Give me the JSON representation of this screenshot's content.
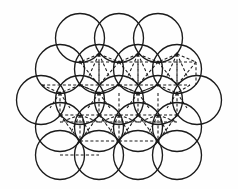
{
  "figure": {
    "name": "close-packed-sphere-stacking-diagram",
    "background_color": "#fefefe",
    "line_color": "#1a1a1a",
    "stroke_width": 1.35,
    "dashed_stroke_width": 1.05,
    "dash_pattern": "3 2.2"
  },
  "chart_data": {
    "type": "scatter",
    "xlabel": "",
    "ylabel": "",
    "xlim": [
      0,
      238
    ],
    "ylim": [
      0,
      189
    ],
    "grid": false,
    "legend": "none",
    "circle_radius": 24.5,
    "row_counts": [
      3,
      4,
      5,
      4,
      4
    ],
    "rows": [
      {
        "row": 1,
        "count": 3,
        "cy": 38,
        "cxs": [
          80,
          119,
          158
        ]
      },
      {
        "row": 2,
        "count": 4,
        "cy": 69,
        "cxs": [
          60,
          99,
          138,
          177
        ]
      },
      {
        "row": 3,
        "count": 5,
        "cy": 100,
        "cxs": [
          41,
          80,
          119,
          158,
          197
        ]
      },
      {
        "row": 4,
        "count": 4,
        "cy": 127,
        "cxs": [
          60,
          99,
          138,
          177
        ]
      },
      {
        "row": 5,
        "count": 4,
        "cy": 155,
        "cxs": [
          60,
          99,
          138,
          177
        ]
      }
    ],
    "circles": [
      {
        "cx": 80,
        "cy": 38,
        "r": 24.5
      },
      {
        "cx": 119,
        "cy": 38,
        "r": 24.5
      },
      {
        "cx": 158,
        "cy": 38,
        "r": 24.5
      },
      {
        "cx": 60,
        "cy": 69,
        "r": 24.5
      },
      {
        "cx": 99,
        "cy": 69,
        "r": 24.5
      },
      {
        "cx": 138,
        "cy": 69,
        "r": 24.5
      },
      {
        "cx": 177,
        "cy": 69,
        "r": 24.5
      },
      {
        "cx": 41,
        "cy": 100,
        "r": 24.5
      },
      {
        "cx": 80,
        "cy": 100,
        "r": 24.5
      },
      {
        "cx": 119,
        "cy": 100,
        "r": 24.5
      },
      {
        "cx": 158,
        "cy": 100,
        "r": 24.5
      },
      {
        "cx": 197,
        "cy": 100,
        "r": 24.5
      },
      {
        "cx": 60,
        "cy": 127,
        "r": 24.5
      },
      {
        "cx": 99,
        "cy": 127,
        "r": 24.5
      },
      {
        "cx": 138,
        "cy": 127,
        "r": 24.5
      },
      {
        "cx": 177,
        "cy": 127,
        "r": 24.5
      },
      {
        "cx": 60,
        "cy": 155,
        "r": 24.5
      },
      {
        "cx": 99,
        "cy": 155,
        "r": 24.5
      },
      {
        "cx": 138,
        "cy": 155,
        "r": 24.5
      },
      {
        "cx": 177,
        "cy": 155,
        "r": 24.5
      }
    ],
    "lattice_nodes": [
      {
        "x": 99,
        "y": 54
      },
      {
        "x": 138,
        "y": 54
      },
      {
        "x": 177,
        "y": 54
      },
      {
        "x": 80,
        "y": 62
      },
      {
        "x": 119,
        "y": 62
      },
      {
        "x": 158,
        "y": 62
      },
      {
        "x": 80,
        "y": 85
      },
      {
        "x": 119,
        "y": 85
      },
      {
        "x": 158,
        "y": 85
      },
      {
        "x": 60,
        "y": 93
      },
      {
        "x": 99,
        "y": 93
      },
      {
        "x": 138,
        "y": 93
      },
      {
        "x": 177,
        "y": 93
      },
      {
        "x": 60,
        "y": 115
      },
      {
        "x": 99,
        "y": 115
      },
      {
        "x": 138,
        "y": 115
      },
      {
        "x": 177,
        "y": 115
      },
      {
        "x": 80,
        "y": 141
      },
      {
        "x": 119,
        "y": 141
      },
      {
        "x": 158,
        "y": 141
      }
    ],
    "interstitial_polyhedra": [
      {
        "id": "tetra-top-left",
        "kind": "tetrahedron",
        "apex": {
          "x": 99,
          "y": 54
        },
        "base": [
          {
            "x": 80,
            "y": 62
          },
          {
            "x": 119,
            "y": 62
          },
          {
            "x": 99,
            "y": 85
          }
        ]
      },
      {
        "id": "tetra-top-mid",
        "kind": "tetrahedron",
        "apex": {
          "x": 138,
          "y": 54
        },
        "base": [
          {
            "x": 119,
            "y": 62
          },
          {
            "x": 158,
            "y": 62
          },
          {
            "x": 138,
            "y": 85
          }
        ]
      },
      {
        "id": "tetra-top-right",
        "kind": "tetrahedron",
        "apex": {
          "x": 177,
          "y": 54
        },
        "base": [
          {
            "x": 158,
            "y": 62
          },
          {
            "x": 196,
            "y": 62
          },
          {
            "x": 177,
            "y": 85
          }
        ]
      },
      {
        "id": "octa-center-left",
        "kind": "octahedron",
        "vertices": [
          {
            "x": 80,
            "y": 85
          },
          {
            "x": 119,
            "y": 85
          },
          {
            "x": 99,
            "y": 93
          },
          {
            "x": 99,
            "y": 62
          }
        ]
      },
      {
        "id": "octa-center-right",
        "kind": "octahedron",
        "vertices": [
          {
            "x": 138,
            "y": 85
          },
          {
            "x": 177,
            "y": 85
          },
          {
            "x": 158,
            "y": 93
          },
          {
            "x": 158,
            "y": 62
          }
        ]
      },
      {
        "id": "tetra-mid-left",
        "kind": "tetrahedron",
        "apex": {
          "x": 99,
          "y": 93
        },
        "base": [
          {
            "x": 80,
            "y": 85
          },
          {
            "x": 119,
            "y": 85
          },
          {
            "x": 99,
            "y": 115
          }
        ]
      },
      {
        "id": "tetra-mid-center",
        "kind": "tetrahedron",
        "apex": {
          "x": 138,
          "y": 93
        },
        "base": [
          {
            "x": 119,
            "y": 85
          },
          {
            "x": 158,
            "y": 85
          },
          {
            "x": 138,
            "y": 115
          }
        ]
      },
      {
        "id": "tetra-lower-left",
        "kind": "tetrahedron",
        "apex": {
          "x": 80,
          "y": 115
        },
        "base": [
          {
            "x": 60,
            "y": 122
          },
          {
            "x": 99,
            "y": 122
          },
          {
            "x": 80,
            "y": 141
          }
        ]
      },
      {
        "id": "tetra-lower-mid",
        "kind": "tetrahedron",
        "apex": {
          "x": 119,
          "y": 115
        },
        "base": [
          {
            "x": 99,
            "y": 122
          },
          {
            "x": 138,
            "y": 122
          },
          {
            "x": 119,
            "y": 141
          }
        ]
      },
      {
        "id": "tetra-lower-right",
        "kind": "tetrahedron",
        "apex": {
          "x": 158,
          "y": 115
        },
        "base": [
          {
            "x": 138,
            "y": 122
          },
          {
            "x": 177,
            "y": 122
          },
          {
            "x": 158,
            "y": 141
          }
        ]
      }
    ],
    "dashed_segments": [
      [
        80,
        62,
        119,
        62
      ],
      [
        119,
        62,
        158,
        62
      ],
      [
        158,
        62,
        196,
        62
      ],
      [
        80,
        62,
        99,
        85
      ],
      [
        119,
        62,
        99,
        85
      ],
      [
        119,
        62,
        138,
        85
      ],
      [
        158,
        62,
        138,
        85
      ],
      [
        158,
        62,
        177,
        85
      ],
      [
        196,
        62,
        177,
        85
      ],
      [
        99,
        54,
        80,
        62
      ],
      [
        99,
        54,
        119,
        62
      ],
      [
        99,
        54,
        99,
        85
      ],
      [
        99,
        54,
        88,
        78
      ],
      [
        99,
        54,
        110,
        78
      ],
      [
        138,
        54,
        119,
        62
      ],
      [
        138,
        54,
        158,
        62
      ],
      [
        138,
        54,
        138,
        85
      ],
      [
        138,
        54,
        127,
        78
      ],
      [
        138,
        54,
        149,
        78
      ],
      [
        177,
        54,
        158,
        62
      ],
      [
        177,
        54,
        196,
        62
      ],
      [
        177,
        54,
        177,
        85
      ],
      [
        177,
        54,
        166,
        78
      ],
      [
        177,
        54,
        188,
        78
      ],
      [
        80,
        85,
        119,
        85
      ],
      [
        119,
        85,
        158,
        85
      ],
      [
        158,
        85,
        190,
        85
      ],
      [
        42,
        85,
        80,
        85
      ],
      [
        80,
        85,
        99,
        93
      ],
      [
        119,
        85,
        99,
        93
      ],
      [
        119,
        85,
        138,
        93
      ],
      [
        158,
        85,
        138,
        93
      ],
      [
        158,
        85,
        177,
        93
      ],
      [
        190,
        85,
        177,
        93
      ],
      [
        42,
        85,
        60,
        93
      ],
      [
        80,
        85,
        60,
        93
      ],
      [
        99,
        93,
        80,
        85
      ],
      [
        99,
        93,
        119,
        85
      ],
      [
        99,
        93,
        99,
        115
      ],
      [
        99,
        93,
        88,
        108
      ],
      [
        99,
        93,
        110,
        108
      ],
      [
        138,
        93,
        119,
        85
      ],
      [
        138,
        93,
        158,
        85
      ],
      [
        138,
        93,
        138,
        115
      ],
      [
        138,
        93,
        127,
        108
      ],
      [
        138,
        93,
        149,
        108
      ],
      [
        60,
        93,
        60,
        115
      ],
      [
        60,
        93,
        50,
        108
      ],
      [
        60,
        93,
        70,
        108
      ],
      [
        177,
        93,
        177,
        115
      ],
      [
        177,
        93,
        167,
        108
      ],
      [
        177,
        93,
        187,
        108
      ],
      [
        60,
        115,
        99,
        115
      ],
      [
        99,
        115,
        138,
        115
      ],
      [
        138,
        115,
        177,
        115
      ],
      [
        60,
        115,
        80,
        141
      ],
      [
        99,
        115,
        80,
        141
      ],
      [
        99,
        115,
        119,
        141
      ],
      [
        138,
        115,
        119,
        141
      ],
      [
        138,
        115,
        158,
        141
      ],
      [
        177,
        115,
        158,
        141
      ],
      [
        80,
        115,
        60,
        122
      ],
      [
        80,
        115,
        99,
        122
      ],
      [
        80,
        115,
        80,
        141
      ],
      [
        80,
        115,
        70,
        134
      ],
      [
        80,
        115,
        90,
        134
      ],
      [
        119,
        115,
        99,
        122
      ],
      [
        119,
        115,
        138,
        122
      ],
      [
        119,
        115,
        119,
        141
      ],
      [
        119,
        115,
        109,
        134
      ],
      [
        119,
        115,
        129,
        134
      ],
      [
        158,
        115,
        138,
        122
      ],
      [
        158,
        115,
        177,
        122
      ],
      [
        158,
        115,
        158,
        141
      ],
      [
        158,
        115,
        148,
        134
      ],
      [
        158,
        115,
        168,
        134
      ],
      [
        60,
        122,
        99,
        122
      ],
      [
        99,
        122,
        138,
        122
      ],
      [
        138,
        122,
        177,
        122
      ],
      [
        99,
        62,
        99,
        85
      ],
      [
        138,
        62,
        138,
        85
      ],
      [
        177,
        62,
        177,
        85
      ],
      [
        119,
        93,
        119,
        115
      ],
      [
        158,
        93,
        158,
        115
      ],
      [
        196,
        62,
        196,
        85
      ],
      [
        80,
        141,
        119,
        141
      ],
      [
        119,
        141,
        158,
        141
      ],
      [
        60,
        155,
        99,
        155
      ]
    ]
  }
}
